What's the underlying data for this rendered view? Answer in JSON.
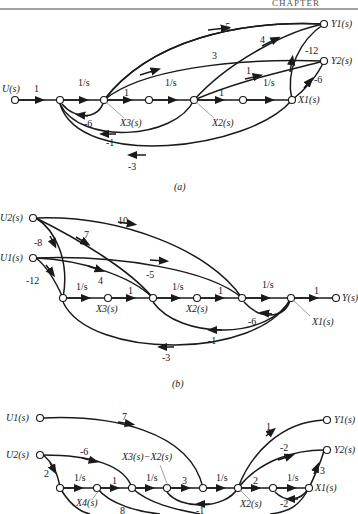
{
  "header": {
    "running_title": "CHAPTER"
  },
  "figures": {
    "a": {
      "caption": "(a)",
      "nodes": {
        "input": "U(s)",
        "x3": "X3(s)",
        "x2": "X2(s)",
        "x1": "X1(s)",
        "y1": "Y1(s)",
        "y2": "Y2(s)"
      },
      "gains": {
        "u_in": "1",
        "int1": "1/s",
        "g_x3_next": "1",
        "int2": "1/s",
        "g_x2_next": "1",
        "int3": "1/s",
        "x3_to_y1": "-5",
        "x3_to_y2": "3",
        "x2_to_y1": "4",
        "x2_to_y2": "1",
        "x1_to_y1": "-12",
        "x1_to_y2": "-6",
        "fb_x3": "-6",
        "fb_x2": "-1",
        "fb_x1": "-3"
      }
    },
    "b": {
      "caption": "(b)",
      "nodes": {
        "u2": "U2(s)",
        "u1": "U1(s)",
        "x3": "X3(s)",
        "x2": "X2(s)",
        "x1": "X1(s)",
        "y": "Y(s)"
      },
      "gains": {
        "u2_to_sum": "-8",
        "u2_mid": "7",
        "u2_late": "10",
        "u1_to_sum": "-12",
        "u1_mid": "4",
        "u1_late": "-5",
        "int1": "1/s",
        "g_x3_next": "1",
        "int2": "1/s",
        "g_x2_next": "1",
        "int3": "1/s",
        "out": "1",
        "fb_a": "-6",
        "fb_b": "-1",
        "fb_c": "-3"
      }
    },
    "c": {
      "caption": "(c)",
      "nodes": {
        "u1": "U1(s)",
        "u2": "U2(s)",
        "x4": "X4(s)",
        "x3mx2": "X3(s)−X2(s)",
        "x2": "X2(s)",
        "x1": "X1(s)",
        "y1": "Y1(s)",
        "y2": "Y2(s)"
      },
      "gains": {
        "u1_late": "7",
        "u2_mid": "-6",
        "u2_to_sum": "2",
        "int1": "1/s",
        "g_x4_next": "1",
        "int2": "1/s",
        "g_mid": "3",
        "int3": "1/s",
        "g_x2_next": "2",
        "int4": "1/s",
        "x2_to_y1": "1",
        "x2_to_y2": "-2",
        "x1_to_y2": "3",
        "fb_x1": "-2",
        "fb_mid": "-1",
        "fb_low": "8"
      }
    }
  }
}
